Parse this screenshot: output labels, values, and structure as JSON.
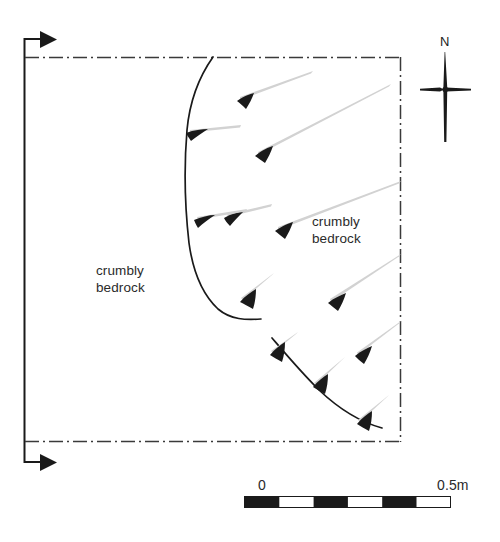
{
  "figure": {
    "type": "archaeological-plan-diagram",
    "background_color": "#ffffff",
    "ink_color": "#1a1a1a",
    "arrow_tail_color": "#cfcfcf",
    "labels": {
      "bedrock_left": "crumbly\nbedrock",
      "bedrock_right": "crumbly\nbedrock",
      "north": "N"
    },
    "scale_bar": {
      "start_label": "0",
      "end_label": "0.5m",
      "segments": 6,
      "filled_segments": [
        0,
        2,
        4
      ]
    },
    "excavation_boundary": {
      "style": "dash-dot",
      "top_y": 57,
      "bottom_y": 441,
      "left_x": 25,
      "right_x": 400
    },
    "baseline_axis": {
      "style": "solid-with-arrowheads",
      "x": 24,
      "top_y": 38,
      "bottom_y": 463,
      "arrow_direction": "right"
    },
    "feature_curves": [
      {
        "name": "upper-cut-edge",
        "points": "213,57 199,83 189,121 186,175 187,228 193,272 205,300 221,317 260,319"
      },
      {
        "name": "lower-cut-edge",
        "points": "272,338 290,360 312,384 336,404 360,419 381,427"
      }
    ],
    "slope_arrows": [
      {
        "tip_x": 237,
        "tip_y": 101,
        "tail_x": 312,
        "tail_y": 72
      },
      {
        "tip_x": 255,
        "tip_y": 156,
        "tail_x": 390,
        "tail_y": 85
      },
      {
        "tip_x": 186,
        "tip_y": 133,
        "tail_x": 239,
        "tail_y": 126
      },
      {
        "tip_x": 224,
        "tip_y": 218,
        "tail_x": 271,
        "tail_y": 205
      },
      {
        "tip_x": 275,
        "tip_y": 231,
        "tail_x": 400,
        "tail_y": 182
      },
      {
        "tip_x": 194,
        "tip_y": 220,
        "tail_x": 246,
        "tail_y": 210
      },
      {
        "tip_x": 240,
        "tip_y": 302,
        "tail_x": 272,
        "tail_y": 274
      },
      {
        "tip_x": 328,
        "tip_y": 303,
        "tail_x": 400,
        "tail_y": 255
      },
      {
        "tip_x": 270,
        "tip_y": 355,
        "tail_x": 297,
        "tail_y": 333
      },
      {
        "tip_x": 313,
        "tip_y": 387,
        "tail_x": 344,
        "tail_y": 358
      },
      {
        "tip_x": 355,
        "tip_y": 356,
        "tail_x": 400,
        "tail_y": 322
      },
      {
        "tip_x": 357,
        "tip_y": 424,
        "tail_x": 388,
        "tail_y": 396
      }
    ]
  }
}
